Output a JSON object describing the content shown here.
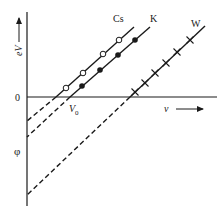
{
  "figure": {
    "type": "photoelectric-effect-diagram",
    "axes": {
      "y_label": "eV",
      "x_label": "v",
      "origin_label": "0",
      "intercept_label": "φ",
      "threshold_label": "V",
      "threshold_subscript": "0"
    },
    "series": [
      {
        "name": "Cs",
        "marker": "open-circle"
      },
      {
        "name": "K",
        "marker": "filled-circle"
      },
      {
        "name": "W",
        "marker": "cross"
      }
    ]
  },
  "colors": {
    "ink": "#1a1a1a",
    "background": "#ffffff"
  }
}
